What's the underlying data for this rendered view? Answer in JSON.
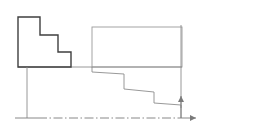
{
  "figure": {
    "width": 256,
    "height": 139,
    "background": "#ffffff",
    "colors": {
      "solid_dark": "#3f3f3f",
      "light_gray": "#9a9a9a",
      "medium_gray": "#6e6e6e",
      "axis_gray": "#7a7a7a",
      "background": "#ffffff"
    },
    "stroke_widths": {
      "solid_dark": 1.4,
      "light_gray": 0.9,
      "axis": 0.9
    }
  },
  "geometry": {
    "left_step_block": {
      "name": "left-stepped-block",
      "description": "closed stepped polygon, three descending treads, dark outline",
      "points": "18,17 40,17 40,35 58,35 58,52 71,52 71,67 18,67 18,17"
    },
    "upper_right_rectangle": {
      "name": "upper-right-rectangle",
      "description": "light gray open rectangle to the right of the block",
      "x": 92,
      "y": 27,
      "width": 90,
      "height": 40
    },
    "upper_baseline": {
      "name": "upper-baseline",
      "description": "horizontal light gray line joining block base to right rectangle base",
      "x1": 18,
      "y1": 67,
      "x2": 182,
      "y2": 67
    },
    "descending_staircase": {
      "name": "descending-staircase-profile",
      "description": "light gray stepped profile descending left-to-right with slightly sloped treads",
      "points": "92,67 92,72 124,74 124,89 154,92 154,103 181,105 181,108"
    },
    "left_vertical_extension": {
      "name": "left-vertical-extension-line",
      "x1": 27,
      "y1": 67,
      "x2": 27,
      "y2": 118
    },
    "right_vertical_extension": {
      "name": "right-vertical-extension-line",
      "x1": 181,
      "y1": 25,
      "x2": 181,
      "y2": 118
    },
    "baseline_solid_segment": {
      "name": "baseline-solid-segment",
      "x1": 15,
      "y1": 118,
      "x2": 38,
      "y2": 118
    },
    "baseline_center_line": {
      "name": "baseline-center-line",
      "description": "dash-dot center line running to the origin",
      "x1": 38,
      "y1": 118,
      "x2": 181,
      "y2": 118,
      "dash_pattern": "9,2.5,1.5,2.5"
    },
    "horizontal_axis_arrow": {
      "name": "horizontal-axis-arrow",
      "x1": 181,
      "y1": 118,
      "x2": 196,
      "y2": 118,
      "head": "196,118 190,115 190,121"
    },
    "vertical_axis_arrow": {
      "name": "vertical-axis-arrow",
      "x1": 181,
      "y1": 118,
      "x2": 181,
      "y2": 96,
      "head": "181,96 178,102 184,102"
    }
  },
  "labels": {
    "none_visible": ""
  }
}
